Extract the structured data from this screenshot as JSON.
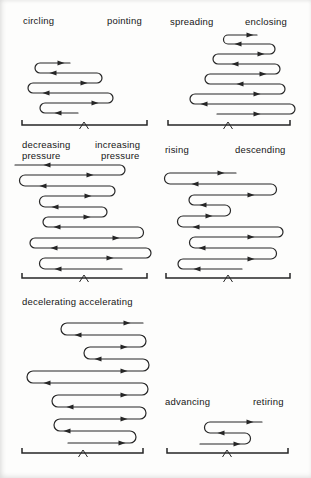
{
  "figure": {
    "background": "#fdfdfc",
    "stroke_color": "#262626",
    "panels": [
      {
        "id": "circling-pointing",
        "labels": [
          {
            "text": "circling",
            "x": 23,
            "y": 15
          },
          {
            "text": "pointing",
            "x": 107,
            "y": 15
          }
        ],
        "rows": [
          [
            63,
            40,
            70,
            "R",
            61
          ],
          [
            73,
            40,
            97,
            "L",
            53
          ],
          [
            83,
            33,
            97,
            "R",
            84
          ],
          [
            93,
            33,
            108,
            "L",
            46
          ],
          [
            103,
            45,
            108,
            "R",
            95
          ],
          [
            113,
            45,
            78,
            "L",
            58
          ]
        ],
        "bracket": {
          "y": 125,
          "x1": 22,
          "x2": 147,
          "caret_x": 84
        }
      },
      {
        "id": "spreading-enclosing",
        "labels": [
          {
            "text": "spreading",
            "x": 170,
            "y": 16
          },
          {
            "text": "enclosing",
            "x": 245,
            "y": 16
          }
        ],
        "rows": [
          [
            35,
            228,
            257,
            "R",
            250
          ],
          [
            44,
            228,
            270,
            "L",
            238
          ],
          [
            54,
            218,
            270,
            "R",
            261
          ],
          [
            64,
            218,
            275,
            "L",
            235
          ],
          [
            74,
            210,
            275,
            "R",
            263
          ],
          [
            84,
            210,
            280,
            "L",
            240
          ],
          [
            94,
            195,
            280,
            "R",
            257
          ],
          [
            104,
            195,
            290,
            "L",
            204
          ],
          [
            114,
            217,
            290,
            "R",
            257
          ]
        ],
        "bracket": {
          "y": 125,
          "x1": 168,
          "x2": 290,
          "caret_x": 228
        }
      },
      {
        "id": "decreasing-increasing-pressure",
        "labels": [
          {
            "text": "decreasing",
            "x": 22,
            "y": 139
          },
          {
            "text": "pressure",
            "x": 22,
            "y": 150
          },
          {
            "text": "increasing",
            "x": 95,
            "y": 139
          },
          {
            "text": "pressure",
            "x": 101,
            "y": 150
          }
        ],
        "rows": [
          [
            165,
            15,
            120,
            "L",
            47
          ],
          [
            175,
            25,
            120,
            "R",
            90
          ],
          [
            186,
            25,
            110,
            "L",
            43
          ],
          [
            196,
            45,
            110,
            "R",
            88
          ],
          [
            207,
            45,
            102,
            "L",
            55
          ],
          [
            217,
            48,
            102,
            "R",
            87
          ],
          [
            227,
            48,
            138,
            "L",
            57
          ],
          [
            238,
            35,
            138,
            "R",
            116
          ],
          [
            248,
            35,
            146,
            "L",
            54
          ],
          [
            258,
            45,
            146,
            "R",
            110
          ],
          [
            269,
            45,
            122,
            "L",
            58
          ]
        ],
        "bracket": {
          "y": 278,
          "x1": 22,
          "x2": 147,
          "caret_x": 84
        }
      },
      {
        "id": "rising-descending",
        "labels": [
          {
            "text": "rising",
            "x": 165,
            "y": 144
          },
          {
            "text": "descending",
            "x": 235,
            "y": 144
          }
        ],
        "rows": [
          [
            173,
            170,
            236,
            "R",
            221
          ],
          [
            184,
            170,
            271,
            "L",
            195
          ],
          [
            195,
            194,
            271,
            "R",
            251
          ],
          [
            205,
            194,
            225,
            "L",
            203
          ],
          [
            216,
            183,
            225,
            "R",
            209
          ],
          [
            227,
            183,
            278,
            "L",
            196
          ],
          [
            237,
            195,
            278,
            "R",
            251
          ],
          [
            248,
            195,
            271,
            "L",
            202
          ],
          [
            259,
            183,
            271,
            "R",
            251
          ],
          [
            269,
            183,
            242,
            "L",
            197
          ]
        ],
        "bracket": {
          "y": 278,
          "x1": 166,
          "x2": 290,
          "caret_x": 228
        }
      },
      {
        "id": "decelerating-accelerating",
        "labels": [
          {
            "text": "decelerating",
            "x": 22,
            "y": 296
          },
          {
            "text": "accelerating",
            "x": 79,
            "y": 296
          }
        ],
        "rows": [
          [
            323,
            67,
            143,
            "R",
            127
          ],
          [
            335,
            67,
            140,
            "L",
            78
          ],
          [
            347,
            90,
            140,
            "R",
            124
          ],
          [
            359,
            90,
            143,
            "L",
            98
          ],
          [
            371,
            33,
            143,
            "R",
            124
          ],
          [
            383,
            33,
            142,
            "L",
            47
          ],
          [
            395,
            58,
            142,
            "R",
            124
          ],
          [
            407,
            58,
            140,
            "L",
            70
          ],
          [
            419,
            60,
            140,
            "R",
            124
          ],
          [
            431,
            60,
            130,
            "L",
            67
          ],
          [
            443,
            68,
            130,
            "R",
            122
          ]
        ],
        "bracket": {
          "y": 453,
          "x1": 22,
          "x2": 143,
          "caret_x": 83
        }
      },
      {
        "id": "advancing-retiring",
        "labels": [
          {
            "text": "advancing",
            "x": 165,
            "y": 396
          },
          {
            "text": "retiring",
            "x": 253,
            "y": 396
          }
        ],
        "rows": [
          [
            422,
            210,
            262,
            "R",
            250
          ],
          [
            433,
            210,
            245,
            "L",
            221
          ],
          [
            444,
            200,
            245,
            "R",
            237
          ]
        ],
        "bracket": {
          "y": 453,
          "x1": 167,
          "x2": 288,
          "caret_x": 227
        }
      }
    ]
  }
}
